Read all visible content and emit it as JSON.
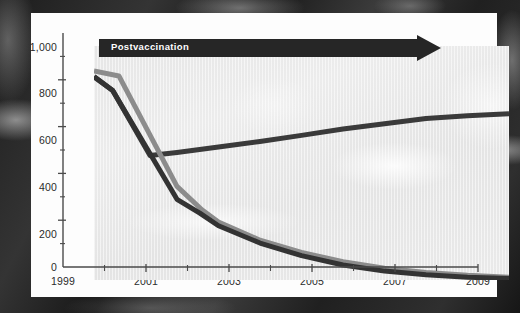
{
  "figure": {
    "banner_label": "Postvaccination",
    "banner_color": "#262626",
    "panel_color": "#fdfdfd",
    "plot_bg_color": "#e8e8e8"
  },
  "chart_data": {
    "type": "line",
    "title": "",
    "subtitle": "",
    "xlabel": "",
    "ylabel": "",
    "xlim": [
      1999,
      2009
    ],
    "ylim": [
      0,
      1000
    ],
    "grid": false,
    "legend_position": "none",
    "annotations": [
      {
        "text": "Postvaccination",
        "type": "arrow-banner",
        "x_start": 1999,
        "x_end": 2007.4,
        "y": 960
      }
    ],
    "y_ticks_major": [
      0,
      200,
      400,
      600,
      800,
      1000
    ],
    "y_tick_labels": [
      "0",
      "200",
      "400",
      "600",
      "800",
      "1,000"
    ],
    "y_ticks_minor": [
      100,
      300,
      500,
      700,
      900
    ],
    "x_ticks_major": [
      1999,
      2001,
      2003,
      2005,
      2007,
      2009
    ],
    "x_tick_labels": [
      "1999",
      "2001",
      "2003",
      "2005",
      "2007",
      "2009"
    ],
    "x_ticks_minor": [
      2000,
      2002,
      2004,
      2006,
      2008
    ],
    "series": [
      {
        "name": "series-upper-dark",
        "color": "#3a3a3a",
        "width": 5,
        "x": [
          1999,
          1999.45,
          2000.35,
          2001,
          2002,
          2003,
          2004,
          2005,
          2006,
          2007,
          2008,
          2009
        ],
        "values": [
          870,
          810,
          532,
          545,
          568,
          592,
          618,
          645,
          668,
          690,
          702,
          710
        ]
      },
      {
        "name": "series-lower-gray",
        "color": "#8c8c8c",
        "width": 5,
        "x": [
          1999,
          1999.6,
          2001,
          2001.6,
          2002,
          2003,
          2004,
          2005,
          2006,
          2007,
          2008,
          2009
        ],
        "values": [
          893,
          872,
          400,
          300,
          248,
          170,
          118,
          78,
          50,
          32,
          20,
          12
        ]
      },
      {
        "name": "series-lower-dark",
        "color": "#333333",
        "width": 5,
        "x": [
          1999,
          1999.45,
          2001,
          2001.55,
          2002,
          2003,
          2004,
          2005,
          2006,
          2007,
          2008,
          2009
        ],
        "values": [
          868,
          810,
          345,
          286,
          232,
          158,
          104,
          64,
          38,
          22,
          12,
          6
        ]
      }
    ]
  }
}
